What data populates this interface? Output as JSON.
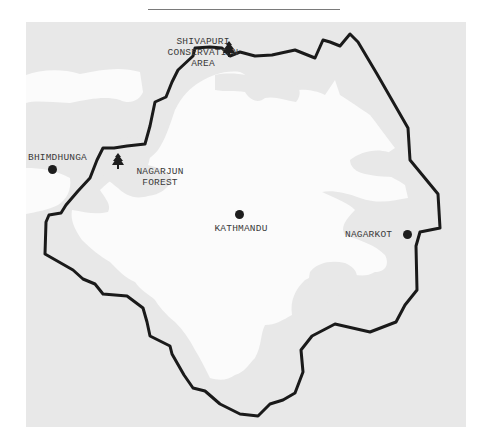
{
  "map": {
    "colors": {
      "surrounding_terrain": "#e8e8e8",
      "valley_floor": "#fbfbfb",
      "boundary_line": "#1a1a1a",
      "label_text": "#3a3a3a",
      "marker": "#1e1e1e"
    },
    "places": [
      {
        "id": "kathmandu",
        "name": "KATHMANDU",
        "type": "city",
        "icon": "city-dot-icon"
      },
      {
        "id": "nagarkot",
        "name": "NAGARKOT",
        "type": "town",
        "icon": "town-dot-icon"
      },
      {
        "id": "bhimdhunga",
        "name": "BHIMDHUNGA",
        "type": "town",
        "icon": "town-dot-icon"
      }
    ],
    "protected_areas": [
      {
        "id": "shivapuri",
        "lines": [
          "SHIVAPURI",
          "CONSERVATION",
          "AREA"
        ],
        "icon": "tree-icon"
      },
      {
        "id": "nagarjun",
        "lines": [
          "NAGARJUN",
          "FOREST"
        ],
        "icon": "tree-icon"
      }
    ]
  }
}
